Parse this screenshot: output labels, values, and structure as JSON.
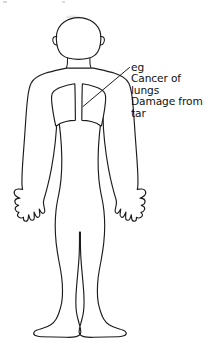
{
  "page": {
    "background_color": "#ffffff",
    "ink_color": "#1c1c1c",
    "width": 208,
    "height": 349
  },
  "annotation": {
    "name": "lung-damage-callout",
    "lines": [
      "eg",
      "Cancer of",
      "lungs",
      "Damage from",
      "tar"
    ],
    "full_text": "eg Cancer of lungs Damage from tar",
    "text_color": "#111111",
    "leader_line": {
      "from_x": 129,
      "from_y": 68,
      "to_x": 83,
      "to_y": 106
    }
  },
  "figure": {
    "name": "human-body-outline",
    "parts": [
      "head",
      "ears",
      "neck",
      "shoulders",
      "torso",
      "left-arm",
      "right-arm",
      "left-hand",
      "right-hand",
      "left-leg",
      "right-leg",
      "left-foot",
      "right-foot"
    ]
  },
  "organs": {
    "lungs": {
      "name": "lungs",
      "label": "lungs",
      "count": 2,
      "sides": [
        "left-lobe",
        "right-lobe"
      ],
      "fill_color": "#ffffff",
      "stroke_color": "#1c1c1c"
    }
  }
}
